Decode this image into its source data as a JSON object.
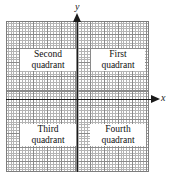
{
  "figure": {
    "type": "coordinate-plane-diagram",
    "background": "#ffffff"
  },
  "axes": {
    "x": {
      "label": "x",
      "arrow_direction": "right",
      "color": "#1a1a1a"
    },
    "y": {
      "label": "y",
      "arrow_direction": "up",
      "color": "#1a1a1a"
    }
  },
  "grid": {
    "minor_color": "#b4b4b4",
    "major_color": "#8a8a8a",
    "major_every": 5,
    "minor_cells_x": 50,
    "minor_cells_y": 53
  },
  "quadrants": [
    {
      "id": "first",
      "line1": "First",
      "line2": "quadrant"
    },
    {
      "id": "second",
      "line1": "Second",
      "line2": "quadrant"
    },
    {
      "id": "third",
      "line1": "Third",
      "line2": "quadrant"
    },
    {
      "id": "fourth",
      "line1": "Fourth",
      "line2": "quadrant"
    }
  ]
}
